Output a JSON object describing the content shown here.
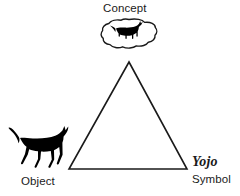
{
  "diagram": {
    "background_color": "#ffffff",
    "stroke_color": "#1a1a1a",
    "fill_color": "#000000",
    "vertices": {
      "concept": {
        "label": "Concept",
        "icon": "cat-silhouette-in-thought-bubble",
        "x": 130,
        "y": 34
      },
      "object": {
        "label": "Object",
        "icon": "cat-silhouette",
        "x": 36,
        "y": 148
      },
      "symbol": {
        "label": "Symbol",
        "word": "Yojo",
        "x": 210,
        "y": 169
      }
    },
    "triangle": {
      "apex": {
        "x": 129,
        "y": 62
      },
      "bottom_left": {
        "x": 69,
        "y": 169
      },
      "bottom_right": {
        "x": 187,
        "y": 169
      },
      "stroke_width": 1.6
    }
  }
}
